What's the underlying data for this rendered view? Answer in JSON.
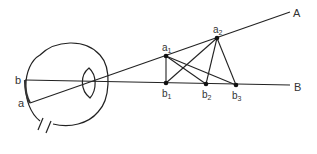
{
  "diagram": {
    "labels": {
      "retina_b": "b",
      "retina_a": "a",
      "line_A": "A",
      "line_B": "B",
      "a1": "a",
      "a1_sub": "1",
      "a2": "a",
      "a2_sub": "2",
      "b1": "b",
      "b1_sub": "1",
      "b2": "b",
      "b2_sub": "2",
      "b3": "b",
      "b3_sub": "3"
    },
    "colors": {
      "stroke": "#222222",
      "text": "#333333"
    }
  }
}
